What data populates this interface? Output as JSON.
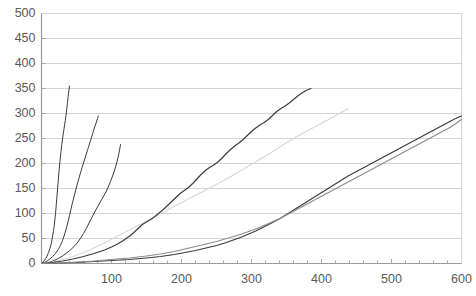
{
  "chart_data": {
    "type": "line",
    "title": "",
    "subtitle": "",
    "xlabel": "",
    "ylabel": "",
    "xlim": [
      0,
      600
    ],
    "ylim": [
      0,
      500
    ],
    "xticks": [
      0,
      100,
      200,
      300,
      400,
      500,
      600
    ],
    "xtick_labels": [
      "",
      "100",
      "200",
      "300",
      "400",
      "500",
      "600"
    ],
    "yticks": [
      0,
      50,
      100,
      150,
      200,
      250,
      300,
      350,
      400,
      450,
      500
    ],
    "ytick_labels": [
      "0",
      "50",
      "100",
      "150",
      "200",
      "250",
      "300",
      "350",
      "400",
      "450",
      "500"
    ],
    "grid": "horizontal",
    "grid_color": "#d4d4d4",
    "axis_color": "#9a9a9a",
    "legend": "none",
    "legend_position": "none",
    "background": "#ffffff",
    "annotations": [],
    "series": [
      {
        "name": "curve-1",
        "color": "#3c3c3c",
        "width": 1.0,
        "x_end": 40,
        "y_end": 355,
        "points": [
          [
            0,
            0
          ],
          [
            2,
            3
          ],
          [
            4,
            6
          ],
          [
            6,
            10
          ],
          [
            8,
            15
          ],
          [
            10,
            22
          ],
          [
            12,
            30
          ],
          [
            14,
            40
          ],
          [
            15,
            48
          ],
          [
            16,
            56
          ],
          [
            17,
            64
          ],
          [
            18,
            74
          ],
          [
            19,
            86
          ],
          [
            20,
            100
          ],
          [
            21,
            116
          ],
          [
            22,
            133
          ],
          [
            23,
            150
          ],
          [
            24,
            167
          ],
          [
            25,
            184
          ],
          [
            26,
            199
          ],
          [
            27,
            213
          ],
          [
            28,
            226
          ],
          [
            29,
            238
          ],
          [
            30,
            249
          ],
          [
            31,
            259
          ],
          [
            32,
            268
          ],
          [
            33,
            277
          ],
          [
            34,
            286
          ],
          [
            35,
            296
          ],
          [
            36,
            308
          ],
          [
            37,
            320
          ],
          [
            38,
            334
          ],
          [
            39,
            345
          ],
          [
            40,
            355
          ]
        ]
      },
      {
        "name": "curve-2",
        "color": "#3c3c3c",
        "width": 1.0,
        "x_end": 81,
        "y_end": 295,
        "points": [
          [
            0,
            0
          ],
          [
            4,
            2
          ],
          [
            8,
            5
          ],
          [
            12,
            9
          ],
          [
            16,
            14
          ],
          [
            20,
            20
          ],
          [
            24,
            28
          ],
          [
            27,
            36
          ],
          [
            30,
            46
          ],
          [
            32,
            54
          ],
          [
            34,
            63
          ],
          [
            36,
            73
          ],
          [
            38,
            84
          ],
          [
            40,
            96
          ],
          [
            42,
            108
          ],
          [
            44,
            120
          ],
          [
            46,
            131
          ],
          [
            48,
            142
          ],
          [
            50,
            153
          ],
          [
            52,
            163
          ],
          [
            54,
            173
          ],
          [
            56,
            183
          ],
          [
            58,
            192
          ],
          [
            60,
            201
          ],
          [
            62,
            210
          ],
          [
            64,
            219
          ],
          [
            66,
            228
          ],
          [
            68,
            237
          ],
          [
            70,
            246
          ],
          [
            72,
            255
          ],
          [
            74,
            264
          ],
          [
            76,
            273
          ],
          [
            78,
            281
          ],
          [
            80,
            290
          ],
          [
            81,
            295
          ]
        ]
      },
      {
        "name": "curve-3",
        "color": "#3c3c3c",
        "width": 1.0,
        "x_end": 113,
        "y_end": 238,
        "points": [
          [
            0,
            0
          ],
          [
            6,
            1
          ],
          [
            12,
            3
          ],
          [
            18,
            6
          ],
          [
            24,
            10
          ],
          [
            30,
            15
          ],
          [
            36,
            21
          ],
          [
            42,
            28
          ],
          [
            48,
            36
          ],
          [
            52,
            43
          ],
          [
            56,
            51
          ],
          [
            60,
            60
          ],
          [
            64,
            70
          ],
          [
            68,
            81
          ],
          [
            72,
            92
          ],
          [
            76,
            103
          ],
          [
            80,
            113
          ],
          [
            84,
            123
          ],
          [
            88,
            133
          ],
          [
            92,
            143
          ],
          [
            95,
            152
          ],
          [
            98,
            162
          ],
          [
            101,
            173
          ],
          [
            104,
            185
          ],
          [
            107,
            199
          ],
          [
            109,
            210
          ],
          [
            111,
            223
          ],
          [
            112,
            231
          ],
          [
            113,
            238
          ]
        ]
      },
      {
        "name": "curve-4",
        "color": "#d8d8d8",
        "width": 1.2,
        "x_end": 438,
        "y_end": 310,
        "points": [
          [
            0,
            0
          ],
          [
            15,
            3
          ],
          [
            30,
            8
          ],
          [
            45,
            14
          ],
          [
            60,
            22
          ],
          [
            75,
            31
          ],
          [
            90,
            41
          ],
          [
            105,
            52
          ],
          [
            120,
            63
          ],
          [
            135,
            74
          ],
          [
            150,
            85
          ],
          [
            165,
            96
          ],
          [
            180,
            107
          ],
          [
            195,
            118
          ],
          [
            210,
            129
          ],
          [
            225,
            140
          ],
          [
            240,
            151
          ],
          [
            255,
            162
          ],
          [
            268,
            172
          ],
          [
            280,
            182
          ],
          [
            292,
            192
          ],
          [
            303,
            201
          ],
          [
            314,
            210
          ],
          [
            325,
            219
          ],
          [
            335,
            228
          ],
          [
            345,
            237
          ],
          [
            354,
            245
          ],
          [
            362,
            252
          ],
          [
            370,
            258
          ],
          [
            378,
            264
          ],
          [
            386,
            270
          ],
          [
            394,
            276
          ],
          [
            402,
            282
          ],
          [
            410,
            288
          ],
          [
            418,
            294
          ],
          [
            426,
            300
          ],
          [
            432,
            305
          ],
          [
            438,
            310
          ]
        ]
      },
      {
        "name": "curve-5",
        "color": "#3c3c3c",
        "width": 1.2,
        "x_end": 385,
        "y_end": 350,
        "points": [
          [
            0,
            0
          ],
          [
            15,
            2
          ],
          [
            30,
            5
          ],
          [
            45,
            9
          ],
          [
            60,
            14
          ],
          [
            75,
            20
          ],
          [
            90,
            27
          ],
          [
            100,
            33
          ],
          [
            110,
            40
          ],
          [
            118,
            47
          ],
          [
            126,
            55
          ],
          [
            132,
            62
          ],
          [
            138,
            70
          ],
          [
            144,
            78
          ],
          [
            150,
            83
          ],
          [
            156,
            88
          ],
          [
            162,
            94
          ],
          [
            168,
            101
          ],
          [
            174,
            108
          ],
          [
            180,
            116
          ],
          [
            186,
            124
          ],
          [
            192,
            132
          ],
          [
            198,
            140
          ],
          [
            204,
            146
          ],
          [
            210,
            152
          ],
          [
            216,
            160
          ],
          [
            222,
            169
          ],
          [
            228,
            178
          ],
          [
            234,
            186
          ],
          [
            240,
            192
          ],
          [
            246,
            197
          ],
          [
            252,
            203
          ],
          [
            258,
            211
          ],
          [
            264,
            220
          ],
          [
            270,
            228
          ],
          [
            276,
            235
          ],
          [
            282,
            241
          ],
          [
            288,
            248
          ],
          [
            294,
            256
          ],
          [
            300,
            264
          ],
          [
            306,
            271
          ],
          [
            312,
            277
          ],
          [
            318,
            282
          ],
          [
            324,
            288
          ],
          [
            330,
            296
          ],
          [
            336,
            304
          ],
          [
            342,
            310
          ],
          [
            348,
            315
          ],
          [
            354,
            321
          ],
          [
            360,
            328
          ],
          [
            366,
            335
          ],
          [
            372,
            341
          ],
          [
            378,
            346
          ],
          [
            385,
            350
          ]
        ]
      },
      {
        "name": "curve-6",
        "color": "#3c3c3c",
        "width": 1.2,
        "x_end": 600,
        "y_end": 295,
        "points": [
          [
            0,
            0
          ],
          [
            25,
            1
          ],
          [
            50,
            2
          ],
          [
            75,
            4
          ],
          [
            100,
            6
          ],
          [
            125,
            8
          ],
          [
            150,
            11
          ],
          [
            170,
            14
          ],
          [
            190,
            18
          ],
          [
            205,
            22
          ],
          [
            220,
            26
          ],
          [
            235,
            31
          ],
          [
            250,
            36
          ],
          [
            262,
            41
          ],
          [
            274,
            47
          ],
          [
            286,
            53
          ],
          [
            296,
            59
          ],
          [
            306,
            65
          ],
          [
            316,
            72
          ],
          [
            326,
            79
          ],
          [
            334,
            85
          ],
          [
            342,
            91
          ],
          [
            350,
            98
          ],
          [
            358,
            105
          ],
          [
            366,
            112
          ],
          [
            374,
            119
          ],
          [
            382,
            126
          ],
          [
            390,
            133
          ],
          [
            398,
            140
          ],
          [
            406,
            147
          ],
          [
            414,
            154
          ],
          [
            422,
            161
          ],
          [
            430,
            168
          ],
          [
            438,
            175
          ],
          [
            446,
            181
          ],
          [
            454,
            187
          ],
          [
            462,
            193
          ],
          [
            470,
            199
          ],
          [
            478,
            205
          ],
          [
            486,
            211
          ],
          [
            494,
            217
          ],
          [
            502,
            223
          ],
          [
            510,
            229
          ],
          [
            518,
            235
          ],
          [
            526,
            241
          ],
          [
            534,
            247
          ],
          [
            542,
            253
          ],
          [
            550,
            259
          ],
          [
            558,
            265
          ],
          [
            566,
            271
          ],
          [
            574,
            277
          ],
          [
            582,
            283
          ],
          [
            590,
            289
          ],
          [
            600,
            295
          ]
        ]
      },
      {
        "name": "curve-7",
        "color": "#8c8c8c",
        "width": 1.2,
        "x_end": 600,
        "y_end": 288,
        "points": [
          [
            0,
            0
          ],
          [
            25,
            1
          ],
          [
            50,
            3
          ],
          [
            75,
            5
          ],
          [
            100,
            8
          ],
          [
            125,
            11
          ],
          [
            150,
            15
          ],
          [
            170,
            19
          ],
          [
            190,
            24
          ],
          [
            205,
            29
          ],
          [
            220,
            34
          ],
          [
            235,
            39
          ],
          [
            250,
            44
          ],
          [
            262,
            49
          ],
          [
            274,
            54
          ],
          [
            286,
            59
          ],
          [
            296,
            64
          ],
          [
            306,
            69
          ],
          [
            316,
            75
          ],
          [
            326,
            81
          ],
          [
            334,
            86
          ],
          [
            342,
            91
          ],
          [
            350,
            97
          ],
          [
            358,
            103
          ],
          [
            366,
            109
          ],
          [
            374,
            115
          ],
          [
            382,
            121
          ],
          [
            390,
            127
          ],
          [
            398,
            133
          ],
          [
            406,
            139
          ],
          [
            414,
            145
          ],
          [
            422,
            151
          ],
          [
            430,
            157
          ],
          [
            438,
            163
          ],
          [
            446,
            169
          ],
          [
            454,
            175
          ],
          [
            462,
            181
          ],
          [
            470,
            187
          ],
          [
            478,
            193
          ],
          [
            486,
            199
          ],
          [
            494,
            205
          ],
          [
            502,
            211
          ],
          [
            510,
            217
          ],
          [
            518,
            223
          ],
          [
            526,
            229
          ],
          [
            534,
            235
          ],
          [
            542,
            241
          ],
          [
            550,
            247
          ],
          [
            558,
            253
          ],
          [
            566,
            259
          ],
          [
            574,
            265
          ],
          [
            582,
            271
          ],
          [
            590,
            278
          ],
          [
            600,
            288
          ]
        ]
      }
    ]
  }
}
